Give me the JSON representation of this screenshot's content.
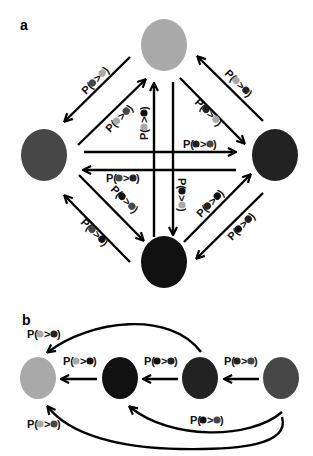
{
  "figure": {
    "panel_a": {
      "label": "a",
      "nodes": [
        {
          "id": "top",
          "color": "#a9a9a9"
        },
        {
          "id": "left",
          "color": "#474747"
        },
        {
          "id": "right",
          "color": "#222222"
        },
        {
          "id": "bottom",
          "color": "#111111"
        }
      ],
      "edges": [
        {
          "from": "top",
          "to": "left",
          "label": "P(",
          "sym_a": "#474747",
          "op": ">",
          "sym_b": "#a9a9a9",
          "close": ")"
        },
        {
          "from": "left",
          "to": "top",
          "label": "P(",
          "sym_a": "#a9a9a9",
          "op": ">",
          "sym_b": "#474747",
          "close": ")"
        },
        {
          "from": "bottom",
          "to": "top",
          "label": "P(",
          "sym_a": "#a9a9a9",
          "op": ">",
          "sym_b": "#111111",
          "close": ")"
        },
        {
          "from": "top",
          "to": "bottom",
          "label": "P(",
          "sym_a": "#111111",
          "op": ">",
          "sym_b": "#a9a9a9",
          "close": ")"
        },
        {
          "from": "top",
          "to": "right",
          "label": "P(",
          "sym_a": "#222222",
          "op": ">",
          "sym_b": "#a9a9a9",
          "close": ")"
        },
        {
          "from": "right",
          "to": "top",
          "label": "P(",
          "sym_a": "#a9a9a9",
          "op": ">",
          "sym_b": "#222222",
          "close": ")"
        },
        {
          "from": "left",
          "to": "right",
          "label": "P(",
          "sym_a": "#222222",
          "op": ">",
          "sym_b": "#474747",
          "close": ")"
        },
        {
          "from": "right",
          "to": "left",
          "label": "P(",
          "sym_a": "#474747",
          "op": ">",
          "sym_b": "#222222",
          "close": ")"
        },
        {
          "from": "left",
          "to": "bottom",
          "label": "P(",
          "sym_a": "#111111",
          "op": ">",
          "sym_b": "#474747",
          "close": ")"
        },
        {
          "from": "bottom",
          "to": "left",
          "label": "P(",
          "sym_a": "#474747",
          "op": ">",
          "sym_b": "#111111",
          "close": ")"
        },
        {
          "from": "bottom",
          "to": "right",
          "label": "P(",
          "sym_a": "#222222",
          "op": ">",
          "sym_b": "#111111",
          "close": ")"
        },
        {
          "from": "right",
          "to": "bottom",
          "label": "P(",
          "sym_a": "#111111",
          "op": ">",
          "sym_b": "#222222",
          "close": ")"
        }
      ]
    },
    "panel_b": {
      "label": "b",
      "nodes": [
        {
          "id": "n1",
          "color": "#a9a9a9"
        },
        {
          "id": "n2",
          "color": "#111111"
        },
        {
          "id": "n3",
          "color": "#222222"
        },
        {
          "id": "n4",
          "color": "#474747"
        }
      ],
      "edges": [
        {
          "from": "n2",
          "to": "n1",
          "label": "P(",
          "sym_a": "#a9a9a9",
          "op": ">",
          "sym_b": "#111111",
          "close": ")"
        },
        {
          "from": "n3",
          "to": "n2",
          "label": "P(",
          "sym_a": "#111111",
          "op": ">",
          "sym_b": "#222222",
          "close": ")"
        },
        {
          "from": "n4",
          "to": "n3",
          "label": "P(",
          "sym_a": "#222222",
          "op": ">",
          "sym_b": "#474747",
          "close": ")"
        },
        {
          "from": "n3",
          "to": "n1",
          "label": "P(",
          "sym_a": "#a9a9a9",
          "op": ">",
          "sym_b": "#222222",
          "close": ")"
        },
        {
          "from": "n4",
          "to": "n2",
          "label": "P(",
          "sym_a": "#111111",
          "op": ">",
          "sym_b": "#474747",
          "close": ")"
        },
        {
          "from": "n4",
          "to": "n1",
          "label": "P(",
          "sym_a": "#a9a9a9",
          "op": ">",
          "sym_b": "#474747",
          "close": ")"
        }
      ]
    }
  }
}
